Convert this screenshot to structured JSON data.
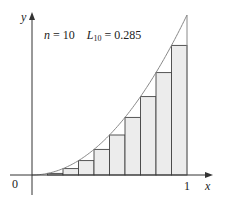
{
  "chart_data": {
    "type": "bar",
    "title": "",
    "annotation": {
      "n_label": "n",
      "n_value": "10",
      "sum_label": "L",
      "sum_subscript": "10",
      "sum_value": "0.285"
    },
    "function": "y = x^2",
    "xlabel": "x",
    "ylabel": "y",
    "x_ticks": [
      "0",
      "1"
    ],
    "xlim": [
      0,
      1
    ],
    "ylim": [
      0,
      1
    ],
    "grid": false,
    "rectangles": {
      "method": "left endpoints",
      "n": 10,
      "x_left": [
        0.0,
        0.1,
        0.2,
        0.3,
        0.4,
        0.5,
        0.6,
        0.7,
        0.8,
        0.9
      ],
      "heights": [
        0.0,
        0.01,
        0.04,
        0.09,
        0.16,
        0.25,
        0.36,
        0.49,
        0.64,
        0.81
      ],
      "width": 0.1
    },
    "colors": {
      "rect_fill": "#ececec",
      "rect_stroke": "#444444",
      "curve": "#888888",
      "axis": "#333333"
    }
  },
  "labels": {
    "n_text": "n",
    "n_eq": " = 10",
    "L_text": "L",
    "L_sub": "10",
    "L_eq": " = 0.285",
    "origin": "0",
    "x_one": "1",
    "x_axis": "x",
    "y_axis": "y"
  }
}
